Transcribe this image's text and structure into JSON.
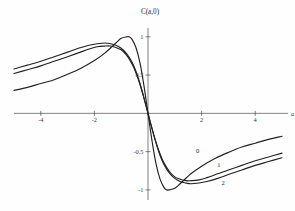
{
  "chart_data": {
    "type": "line",
    "title": "C(a,0)",
    "xlabel": "a",
    "ylabel": "",
    "xlim": [
      -5,
      5
    ],
    "ylim": [
      -1.08,
      1.05
    ],
    "grid": false,
    "legend_position": "inline-annotations",
    "xticks": [
      -4,
      -2,
      2,
      4
    ],
    "xtick_labels": [
      "-4",
      "-2",
      "2",
      "4"
    ],
    "yticks": [
      1,
      0.5,
      -0.5,
      -1
    ],
    "ytick_labels": [
      "1",
      "0.5",
      "-0.5",
      "-1"
    ],
    "series": [
      {
        "name": "0",
        "label": "0",
        "x": [
          -5.0,
          -4.5,
          -4.0,
          -3.5,
          -3.0,
          -2.5,
          -2.0,
          -1.6,
          -1.2,
          -1.0,
          -0.8,
          -0.7,
          -0.6,
          -0.45,
          -0.3,
          -0.15,
          0.0,
          0.15,
          0.3,
          0.45,
          0.6,
          0.7,
          0.8,
          1.0,
          1.2,
          1.6,
          2.0,
          2.5,
          3.0,
          3.5,
          4.0,
          4.5,
          5.0
        ],
        "y": [
          0.3,
          0.34,
          0.39,
          0.44,
          0.51,
          0.59,
          0.69,
          0.79,
          0.92,
          0.98,
          1.0,
          1.0,
          0.97,
          0.86,
          0.66,
          0.36,
          0.0,
          -0.36,
          -0.66,
          -0.86,
          -0.97,
          -1.0,
          -1.0,
          -0.98,
          -0.92,
          -0.79,
          -0.69,
          -0.59,
          -0.51,
          -0.44,
          -0.39,
          -0.34,
          -0.3
        ]
      },
      {
        "name": "1",
        "label": "1",
        "x": [
          -5.0,
          -4.5,
          -4.0,
          -3.5,
          -3.0,
          -2.6,
          -2.2,
          -1.9,
          -1.6,
          -1.4,
          -1.2,
          -1.0,
          -0.8,
          -0.6,
          -0.45,
          -0.3,
          -0.15,
          0.0,
          0.15,
          0.3,
          0.45,
          0.6,
          0.8,
          1.0,
          1.2,
          1.4,
          1.6,
          1.9,
          2.2,
          2.6,
          3.0,
          3.5,
          4.0,
          4.5,
          5.0
        ],
        "y": [
          0.52,
          0.57,
          0.62,
          0.68,
          0.74,
          0.79,
          0.84,
          0.87,
          0.88,
          0.88,
          0.86,
          0.83,
          0.76,
          0.65,
          0.53,
          0.38,
          0.2,
          0.0,
          -0.2,
          -0.38,
          -0.53,
          -0.65,
          -0.76,
          -0.83,
          -0.86,
          -0.88,
          -0.88,
          -0.87,
          -0.84,
          -0.79,
          -0.74,
          -0.68,
          -0.62,
          -0.57,
          -0.52
        ]
      },
      {
        "name": "2",
        "label": "2",
        "x": [
          -5.0,
          -4.5,
          -4.0,
          -3.5,
          -3.0,
          -2.6,
          -2.2,
          -1.9,
          -1.6,
          -1.4,
          -1.2,
          -1.0,
          -0.8,
          -0.6,
          -0.45,
          -0.3,
          -0.15,
          0.0,
          0.15,
          0.3,
          0.45,
          0.6,
          0.8,
          1.0,
          1.2,
          1.4,
          1.6,
          1.9,
          2.2,
          2.6,
          3.0,
          3.5,
          4.0,
          4.5,
          5.0
        ],
        "y": [
          0.58,
          0.63,
          0.68,
          0.74,
          0.8,
          0.85,
          0.89,
          0.91,
          0.92,
          0.91,
          0.89,
          0.85,
          0.78,
          0.67,
          0.55,
          0.39,
          0.2,
          0.0,
          -0.2,
          -0.39,
          -0.55,
          -0.67,
          -0.78,
          -0.85,
          -0.89,
          -0.91,
          -0.92,
          -0.91,
          -0.89,
          -0.85,
          -0.8,
          -0.74,
          -0.68,
          -0.63,
          -0.58
        ]
      }
    ],
    "annotations": [
      {
        "text": "0",
        "x": 1.85,
        "y": -0.52
      },
      {
        "text": "1",
        "x": 2.65,
        "y": -0.7
      },
      {
        "text": "2",
        "x": 2.8,
        "y": -0.93
      }
    ]
  }
}
